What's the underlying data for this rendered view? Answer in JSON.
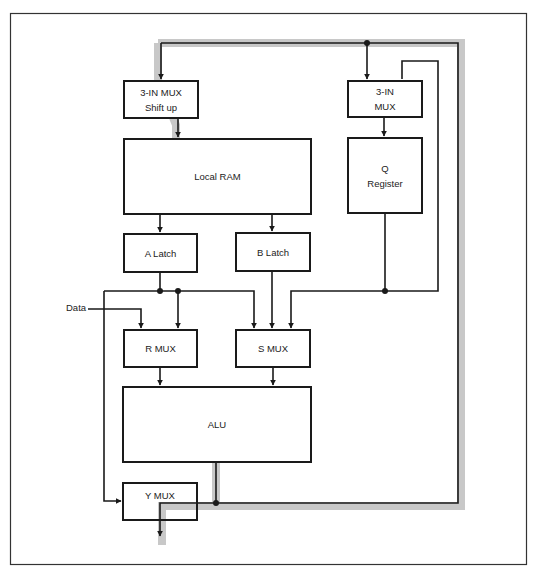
{
  "diagram": {
    "title": "",
    "blocks": {
      "mux_shift": {
        "line1": "3-IN MUX",
        "line2": "Shift up"
      },
      "local_ram": {
        "label": "Local RAM"
      },
      "mux_q": {
        "line1": "3-IN",
        "line2": "MUX"
      },
      "q_register": {
        "line1": "Q",
        "line2": "Register"
      },
      "a_latch": {
        "label": "A Latch"
      },
      "b_latch": {
        "label": "B Latch"
      },
      "r_mux": {
        "label": "R MUX"
      },
      "s_mux": {
        "label": "S MUX"
      },
      "alu": {
        "label": "ALU"
      },
      "y_mux": {
        "label": "Y MUX"
      }
    },
    "inputs": {
      "data": "Data"
    },
    "colors": {
      "line": "#1a1a1a",
      "bus_highlight": "#c8c8c8",
      "frame": "#333333"
    }
  }
}
